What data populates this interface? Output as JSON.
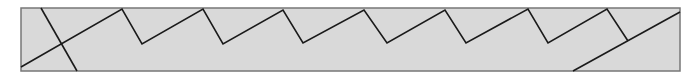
{
  "diagram": {
    "canvas": {
      "width": 695,
      "height": 77,
      "background": "#ffffff"
    },
    "panel": {
      "x": 21,
      "y": 8,
      "width": 659,
      "height": 63,
      "fill": "#d9d9d9",
      "stroke": "#777777"
    },
    "line_color": "#1a1a1a",
    "zigzag": "21,67 122,9 142,44 203,9 223,44 283,10 303,43 364,10 387,43 445,10 466,43 528,9 548,43 607,9 628,41",
    "cross_line": {
      "x1": 41,
      "y1": 8,
      "x2": 77,
      "y2": 71
    },
    "end_line": {
      "x1": 573,
      "y1": 71,
      "x2": 680,
      "y2": 12
    }
  }
}
